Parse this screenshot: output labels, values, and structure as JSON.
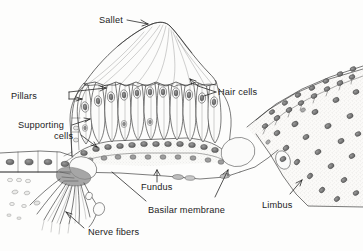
{
  "figure": {
    "background_color": "#fdfdfc",
    "ink_color": "#2a2a2a",
    "label_color": "#1c1c1c"
  },
  "labels": {
    "sallet": "Sallet",
    "hair_cells": "Hair cells",
    "pillars": "Pillars",
    "supporting_line1": "Supporting",
    "supporting_line2": "cells",
    "fundus": "Fundus",
    "basilar_membrane": "Basilar membrane",
    "limbus": "Limbus",
    "nerve_fibers": "Nerve fibers"
  },
  "structures": [
    {
      "name": "sallet",
      "description": "gelatinous tectorial dome above hair cells"
    },
    {
      "name": "hair-cells",
      "description": "row of flask-shaped sensory cells with oval nuclei"
    },
    {
      "name": "pillars",
      "description": "supporting pillar cells at left of papilla"
    },
    {
      "name": "supporting-cells",
      "description": "basal cells beneath hair cells"
    },
    {
      "name": "fundus",
      "description": "floor region of the basilar membrane"
    },
    {
      "name": "basilar-membrane",
      "description": "membrane spanning from left epithelium to limbus"
    },
    {
      "name": "limbus",
      "description": "stippled connective tissue mass at right"
    },
    {
      "name": "nerve-fibers",
      "description": "bundle of afferent fibers fanning down-left"
    },
    {
      "name": "homogene-cell-right",
      "description": "large oval cell at right base of papilla"
    },
    {
      "name": "homogene-cell-left",
      "description": "large oval cell at left base of papilla"
    },
    {
      "name": "left-epithelium",
      "description": "flat epithelial cells at left margin"
    }
  ],
  "ghost_text": " "
}
